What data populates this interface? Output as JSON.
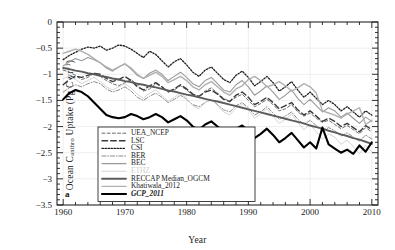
{
  "chart_data": {
    "type": "line",
    "title": "",
    "panel_label": "a",
    "xlabel": "Year",
    "ylabel": "Ocean C_anthro Uptake (Pg C yr^-1)",
    "ylabel_parts": {
      "pre": "Ocean C",
      "sub": "anthro",
      "mid": " Uptake (Pg C yr",
      "sup": "−1",
      "post": ")"
    },
    "xlim": [
      1959,
      2011
    ],
    "ylim": [
      -3.5,
      0
    ],
    "xticks": [
      1960,
      1970,
      1980,
      1990,
      2000,
      2010
    ],
    "yticks": [
      0,
      -0.5,
      -1,
      -1.5,
      -2,
      -2.5,
      -3,
      -3.5
    ],
    "ytick_labels": [
      "0",
      "−0.5",
      "−1",
      "−1.5",
      "−2",
      "−2.5",
      "−3",
      "−3.5"
    ],
    "xtick_labels": [
      "1960",
      "1970",
      "1980",
      "1990",
      "2000",
      "2010"
    ],
    "grid": true,
    "minor_ticks": true,
    "legend_position": "lower-left",
    "x": [
      1960,
      1961,
      1962,
      1963,
      1964,
      1965,
      1966,
      1967,
      1968,
      1969,
      1970,
      1971,
      1972,
      1973,
      1974,
      1975,
      1976,
      1977,
      1978,
      1979,
      1980,
      1981,
      1982,
      1983,
      1984,
      1985,
      1986,
      1987,
      1988,
      1989,
      1990,
      1991,
      1992,
      1993,
      1994,
      1995,
      1996,
      1997,
      1998,
      1999,
      2000,
      2001,
      2002,
      2003,
      2004,
      2005,
      2006,
      2007,
      2008,
      2009,
      2010
    ],
    "series": [
      {
        "name": "UEA_NCEP",
        "style": "dashed",
        "color": "#6d6d6d",
        "width": 1.0,
        "values": [
          -0.92,
          -0.96,
          -1.02,
          -1.1,
          -1.06,
          -0.98,
          -1.04,
          -1.12,
          -1.18,
          -1.22,
          -1.16,
          -1.1,
          -1.2,
          -1.32,
          -1.28,
          -1.18,
          -1.24,
          -1.34,
          -1.3,
          -1.22,
          -1.3,
          -1.4,
          -1.44,
          -1.32,
          -1.26,
          -1.36,
          -1.46,
          -1.52,
          -1.44,
          -1.38,
          -1.5,
          -1.62,
          -1.56,
          -1.48,
          -1.58,
          -1.7,
          -1.66,
          -1.58,
          -1.72,
          -1.8,
          -1.74,
          -1.84,
          -1.92,
          -1.88,
          -1.96,
          -2.04,
          -1.98,
          -2.06,
          -2.14,
          -2.02,
          -2.1
        ]
      },
      {
        "name": "LSC",
        "style": "long-dash",
        "color": "#3a3a3a",
        "width": 1.4,
        "values": [
          -1.2,
          -1.1,
          -1.04,
          -1.06,
          -1.02,
          -0.98,
          -1.0,
          -1.08,
          -1.14,
          -1.1,
          -1.04,
          -1.12,
          -1.24,
          -1.3,
          -1.22,
          -1.16,
          -1.24,
          -1.34,
          -1.28,
          -1.2,
          -1.28,
          -1.38,
          -1.42,
          -1.34,
          -1.3,
          -1.38,
          -1.48,
          -1.52,
          -1.4,
          -1.34,
          -1.44,
          -1.58,
          -1.52,
          -1.44,
          -1.54,
          -1.66,
          -1.6,
          -1.54,
          -1.68,
          -1.78,
          -1.7,
          -1.8,
          -1.9,
          -1.84,
          -1.9,
          -2.0,
          -1.94,
          -2.02,
          -2.1,
          -1.98,
          -2.06
        ]
      },
      {
        "name": "CSI",
        "style": "dotted",
        "color": "#1f1f1f",
        "width": 1.3,
        "values": [
          -0.72,
          -0.64,
          -0.58,
          -0.52,
          -0.48,
          -0.5,
          -0.46,
          -0.54,
          -0.5,
          -0.44,
          -0.46,
          -0.52,
          -0.6,
          -0.68,
          -0.56,
          -0.62,
          -0.74,
          -0.86,
          -0.76,
          -0.7,
          -0.82,
          -0.96,
          -1.04,
          -0.92,
          -0.86,
          -0.98,
          -1.1,
          -1.16,
          -1.02,
          -0.94,
          -1.06,
          -1.22,
          -1.14,
          -1.04,
          -1.16,
          -1.32,
          -1.24,
          -1.14,
          -1.3,
          -1.44,
          -1.34,
          -1.46,
          -1.58,
          -1.5,
          -1.58,
          -1.7,
          -1.62,
          -1.72,
          -1.82,
          -1.7,
          -1.78
        ]
      },
      {
        "name": "BER",
        "style": "dash-dot",
        "color": "#8a8a8a",
        "width": 1.0,
        "values": [
          -1.34,
          -1.26,
          -1.2,
          -1.24,
          -1.18,
          -1.14,
          -1.18,
          -1.28,
          -1.34,
          -1.3,
          -1.24,
          -1.32,
          -1.44,
          -1.5,
          -1.42,
          -1.36,
          -1.44,
          -1.54,
          -1.48,
          -1.4,
          -1.48,
          -1.58,
          -1.62,
          -1.54,
          -1.48,
          -1.58,
          -1.68,
          -1.72,
          -1.6,
          -1.54,
          -1.64,
          -1.78,
          -1.72,
          -1.62,
          -1.74,
          -1.86,
          -1.8,
          -1.72,
          -1.86,
          -1.96,
          -1.88,
          -1.98,
          -2.08,
          -2.02,
          -2.08,
          -2.18,
          -2.12,
          -2.2,
          -2.28,
          -2.16,
          -2.24
        ]
      },
      {
        "name": "BEC",
        "style": "solid",
        "color": "#9a9a9a",
        "width": 1.1,
        "values": [
          -0.84,
          -0.76,
          -0.7,
          -0.74,
          -0.68,
          -0.72,
          -0.78,
          -0.88,
          -0.94,
          -0.86,
          -0.8,
          -0.9,
          -1.02,
          -1.08,
          -0.98,
          -0.92,
          -1.0,
          -1.12,
          -1.04,
          -0.96,
          -1.06,
          -1.18,
          -1.24,
          -1.12,
          -1.06,
          -1.18,
          -1.3,
          -1.34,
          -1.2,
          -1.12,
          -1.24,
          -1.4,
          -1.32,
          -1.22,
          -1.34,
          -1.48,
          -1.4,
          -1.3,
          -1.46,
          -1.58,
          -1.48,
          -1.6,
          -1.72,
          -1.64,
          -1.7,
          -1.82,
          -1.74,
          -1.84,
          -1.94,
          -1.82,
          -1.9
        ]
      },
      {
        "name": "ETHZ",
        "style": "solid",
        "color": "#d4d4d4",
        "width": 1.0,
        "values": [
          -1.08,
          -1.04,
          -1.1,
          -1.18,
          -1.12,
          -1.06,
          -1.14,
          -1.24,
          -1.3,
          -1.24,
          -1.18,
          -1.26,
          -1.38,
          -1.46,
          -1.36,
          -1.3,
          -1.4,
          -1.52,
          -1.44,
          -1.36,
          -1.46,
          -1.6,
          -1.66,
          -1.54,
          -1.48,
          -1.6,
          -1.72,
          -1.78,
          -1.64,
          -1.56,
          -1.68,
          -1.84,
          -1.76,
          -1.66,
          -1.8,
          -1.94,
          -1.86,
          -1.76,
          -1.92,
          -2.06,
          -1.96,
          -2.1,
          -2.24,
          -2.14,
          -2.2,
          -2.34,
          -2.26,
          -2.38,
          -2.52,
          -2.36,
          -2.48
        ]
      },
      {
        "name": "RECCAP Median_OGCM",
        "style": "solid",
        "color": "#5c5c5c",
        "width": 1.9,
        "values": [
          -0.88,
          -0.9,
          -0.93,
          -0.95,
          -0.98,
          -1.0,
          -1.03,
          -1.05,
          -1.08,
          -1.1,
          -1.13,
          -1.15,
          -1.18,
          -1.2,
          -1.23,
          -1.25,
          -1.28,
          -1.31,
          -1.33,
          -1.36,
          -1.39,
          -1.41,
          -1.44,
          -1.47,
          -1.5,
          -1.52,
          -1.55,
          -1.58,
          -1.61,
          -1.64,
          -1.67,
          -1.7,
          -1.73,
          -1.76,
          -1.79,
          -1.82,
          -1.85,
          -1.88,
          -1.91,
          -1.94,
          -1.98,
          -2.01,
          -2.04,
          -2.08,
          -2.11,
          -2.15,
          -2.18,
          -2.22,
          -2.25,
          -2.29,
          -2.33
        ]
      },
      {
        "name": "Khatiwala_2012",
        "style": "solid",
        "color": "#b0b0b0",
        "width": 1.4,
        "values": [
          -0.6,
          -0.56,
          -0.52,
          -0.56,
          -0.62,
          -0.7,
          -0.78,
          -0.86,
          -0.92,
          -0.86,
          -0.8,
          -0.88,
          -1.0,
          -1.08,
          -1.02,
          -0.96,
          -1.04,
          -1.16,
          -1.1,
          -1.04,
          -1.12,
          -1.24,
          -1.3,
          -1.2,
          -1.14,
          -1.24,
          -1.34,
          -1.4,
          -1.28,
          -1.22,
          -1.1,
          -1.04,
          -1.12,
          -1.24,
          -1.2,
          -1.14,
          -1.22,
          -1.32,
          -1.26,
          -1.18,
          -1.24,
          -1.36,
          -1.7,
          -1.74,
          -1.78,
          -1.84,
          -1.76,
          -1.7,
          -1.64,
          -1.96,
          -1.88
        ]
      },
      {
        "name": "GCP_2011",
        "style": "solid",
        "color": "#000000",
        "width": 2.1,
        "values": [
          -1.48,
          -1.36,
          -1.3,
          -1.34,
          -1.42,
          -1.54,
          -1.66,
          -1.78,
          -1.82,
          -1.84,
          -1.82,
          -1.76,
          -1.8,
          -1.86,
          -1.82,
          -1.76,
          -1.82,
          -1.92,
          -1.86,
          -1.8,
          -1.88,
          -2.0,
          -2.06,
          -1.96,
          -1.9,
          -2.0,
          -2.1,
          -2.16,
          -2.04,
          -1.98,
          -2.08,
          -2.22,
          -2.14,
          -2.04,
          -2.16,
          -2.3,
          -2.22,
          -2.12,
          -2.26,
          -2.4,
          -2.3,
          -2.42,
          -2.02,
          -2.34,
          -2.42,
          -2.5,
          -2.44,
          -2.52,
          -2.36,
          -2.48,
          -2.3
        ]
      }
    ]
  },
  "legend": {
    "entries": [
      {
        "label": "UEA_NCEP"
      },
      {
        "label": "LSC"
      },
      {
        "label": "CSI"
      },
      {
        "label": "BER"
      },
      {
        "label": "BEC"
      },
      {
        "label": "ETHZ"
      },
      {
        "label": "RECCAP Median_OGCM"
      },
      {
        "label": "Khatiwala_2012"
      },
      {
        "label": "GCP_2011"
      }
    ]
  }
}
